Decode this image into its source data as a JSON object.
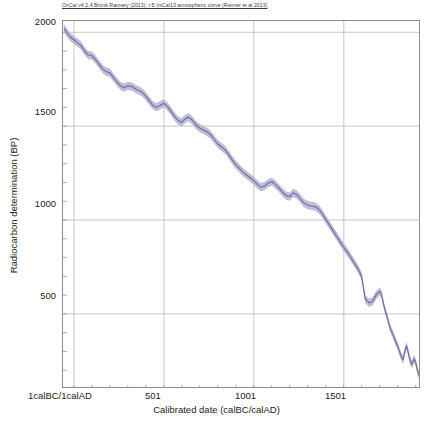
{
  "credit": "OxCal v4.2.4 Bronk Ramsey (2013); r:5 IntCal13 atmospheric curve (Reimer et al 2013)",
  "colors": {
    "curve_line": "#6a6a9e",
    "curve_band": "#b3b3cf",
    "grid": "#b8b8b8",
    "frame": "#8c8c8c",
    "text": "#232323"
  },
  "chart_data": {
    "type": "line",
    "title": "",
    "subtitle": "OxCal v4.2.4 Bronk Ramsey (2013); r:5 IntCal13 atmospheric curve (Reimer et al 2013)",
    "xlabel": "Calibrated date (calBC/calAD)",
    "ylabel": "Radiocarbon determination (BP)",
    "xlim": [
      -60,
      1930
    ],
    "ylim": [
      100,
      2060
    ],
    "grid": true,
    "legend": "none",
    "xticks": [
      1,
      501,
      1001,
      1501
    ],
    "xtick_labels": [
      "1calBC/1calAD",
      "501",
      "1001",
      "1501"
    ],
    "yticks": [
      500,
      1000,
      1500,
      2000
    ],
    "ytick_labels": [
      "500",
      "1000",
      "1500",
      "2000"
    ],
    "series": [
      {
        "name": "IntCal13 atmospheric curve",
        "band": true,
        "band_label": "1-sigma envelope",
        "x": [
          -55,
          -40,
          -20,
          0,
          20,
          40,
          60,
          80,
          100,
          120,
          140,
          160,
          180,
          200,
          220,
          240,
          260,
          280,
          300,
          320,
          340,
          360,
          380,
          400,
          420,
          440,
          460,
          480,
          500,
          520,
          540,
          560,
          580,
          600,
          620,
          640,
          660,
          680,
          700,
          720,
          740,
          760,
          780,
          800,
          820,
          840,
          860,
          880,
          900,
          920,
          940,
          960,
          980,
          1000,
          1020,
          1040,
          1060,
          1080,
          1100,
          1120,
          1140,
          1160,
          1180,
          1200,
          1220,
          1240,
          1260,
          1280,
          1300,
          1320,
          1340,
          1360,
          1380,
          1400,
          1420,
          1440,
          1460,
          1480,
          1500,
          1520,
          1540,
          1560,
          1580,
          1600,
          1620,
          1640,
          1660,
          1680,
          1700,
          1720,
          1740,
          1760,
          1780,
          1800,
          1820,
          1840,
          1860,
          1880,
          1900,
          1920
        ],
        "y": [
          2022,
          2000,
          1975,
          1960,
          1945,
          1930,
          1900,
          1880,
          1875,
          1855,
          1830,
          1805,
          1790,
          1785,
          1760,
          1735,
          1715,
          1705,
          1715,
          1712,
          1700,
          1690,
          1680,
          1660,
          1635,
          1610,
          1600,
          1610,
          1622,
          1605,
          1580,
          1552,
          1530,
          1520,
          1540,
          1548,
          1530,
          1505,
          1490,
          1480,
          1470,
          1455,
          1430,
          1405,
          1390,
          1375,
          1350,
          1320,
          1295,
          1275,
          1255,
          1240,
          1225,
          1210,
          1190,
          1175,
          1180,
          1195,
          1205,
          1190,
          1170,
          1148,
          1130,
          1125,
          1145,
          1135,
          1112,
          1090,
          1080,
          1075,
          1072,
          1060,
          1035,
          1005,
          975,
          945,
          915,
          885,
          855,
          830,
          800,
          770,
          740,
          700,
          660,
          625,
          600,
          580,
          565,
          590,
          620,
          595,
          560,
          520,
          470,
          430,
          390,
          360,
          335,
          330
        ],
        "y_upper_offset": 22,
        "y_lower_offset": 22,
        "detail_x": [
          1620,
          1640,
          1660,
          1680,
          1700,
          1710,
          1720,
          1730,
          1740,
          1750,
          1760,
          1770,
          1780,
          1790,
          1800,
          1810,
          1820,
          1830,
          1840,
          1850,
          1860,
          1870,
          1880,
          1890,
          1900,
          1910,
          1920
        ],
        "detail_y": [
          580,
          560,
          565,
          600,
          620,
          605,
          560,
          520,
          490,
          455,
          420,
          400,
          375,
          350,
          330,
          300,
          275,
          255,
          300,
          330,
          290,
          250,
          230,
          260,
          245,
          200,
          170
        ]
      }
    ]
  }
}
